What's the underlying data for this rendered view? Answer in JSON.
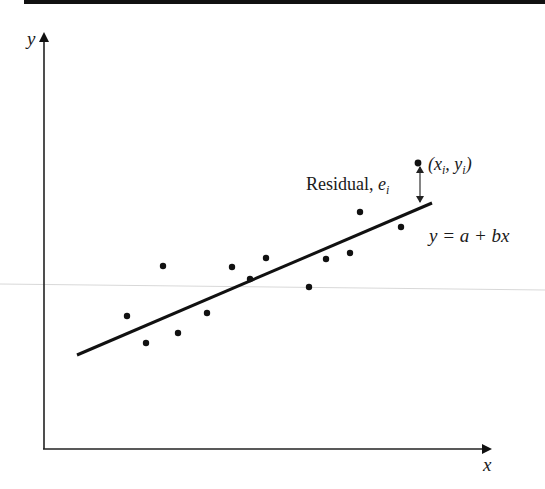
{
  "figure": {
    "top_rule": {
      "x1": 24,
      "x2": 545,
      "y": 2,
      "thickness": 4,
      "color": "#111111"
    },
    "scan_artifact_line": {
      "x1": 0,
      "y1": 284,
      "x2": 545,
      "y2": 290,
      "color": "#d8d8d8"
    },
    "axes": {
      "origin": {
        "x": 44,
        "y": 449
      },
      "y_axis_top": {
        "x": 44,
        "y": 34
      },
      "x_axis_right": {
        "x": 490,
        "y": 449
      },
      "color": "#222222",
      "x_label": "x",
      "y_label": "y"
    },
    "regression_line": {
      "x1": 77,
      "y1": 355,
      "x2": 432,
      "y2": 203,
      "color": "#111111",
      "equation_label": "y = a + bx"
    },
    "data_points": [
      {
        "x": 127,
        "y": 316
      },
      {
        "x": 146,
        "y": 343
      },
      {
        "x": 163,
        "y": 266
      },
      {
        "x": 178,
        "y": 333
      },
      {
        "x": 207,
        "y": 313
      },
      {
        "x": 232,
        "y": 267
      },
      {
        "x": 250,
        "y": 279
      },
      {
        "x": 266,
        "y": 258
      },
      {
        "x": 309,
        "y": 287
      },
      {
        "x": 326,
        "y": 259
      },
      {
        "x": 350,
        "y": 253
      },
      {
        "x": 360,
        "y": 212
      },
      {
        "x": 401,
        "y": 227
      }
    ],
    "highlighted_point": {
      "x": 418,
      "y": 163,
      "label_prefix": "(x",
      "label_sub1": "i",
      "label_mid": ", y",
      "label_sub2": "i",
      "label_suffix": ")"
    },
    "residual": {
      "x": 420,
      "y_top": 166,
      "y_bottom": 203,
      "label_text": "Residual, ",
      "label_var": "e",
      "label_sub": "i"
    }
  }
}
